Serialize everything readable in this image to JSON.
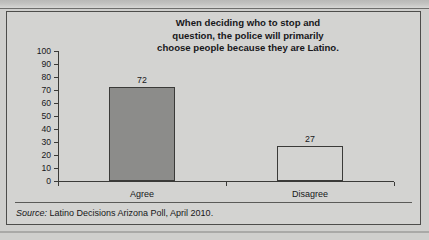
{
  "figure": {
    "title_lines": [
      "When deciding who to stop and",
      "question, the police will primarily",
      "choose people because they are Latino."
    ],
    "title_full": "When deciding who to stop and question, the police will primarily choose people because they are Latino.",
    "source_prefix": "Source:",
    "source_text": " Latino Decisions Arizona Poll, April 2010.",
    "background_color": "#d3d3d1",
    "border_color": "#4d4d4b",
    "axis_color": "#3a3a38"
  },
  "chart_data": {
    "type": "bar",
    "categories": [
      "Agree",
      "Disagree"
    ],
    "values": [
      72,
      27
    ],
    "value_labels": [
      "72",
      "27"
    ],
    "xlabel": "",
    "ylabel": "",
    "ylim": [
      0,
      100
    ],
    "yticks": [
      0,
      10,
      20,
      30,
      40,
      50,
      60,
      70,
      80,
      90,
      100
    ],
    "ytick_labels": [
      "0",
      "10",
      "20",
      "30",
      "40",
      "50",
      "60",
      "70",
      "80",
      "90",
      "100"
    ],
    "grid": false,
    "legend": false,
    "bar_styles": [
      {
        "category": "Agree",
        "fill": "#8c8c8a",
        "outline": "#3a3a38",
        "filled": true
      },
      {
        "category": "Disagree",
        "fill": "none",
        "outline": "#3a3a38",
        "filled": false
      }
    ]
  }
}
